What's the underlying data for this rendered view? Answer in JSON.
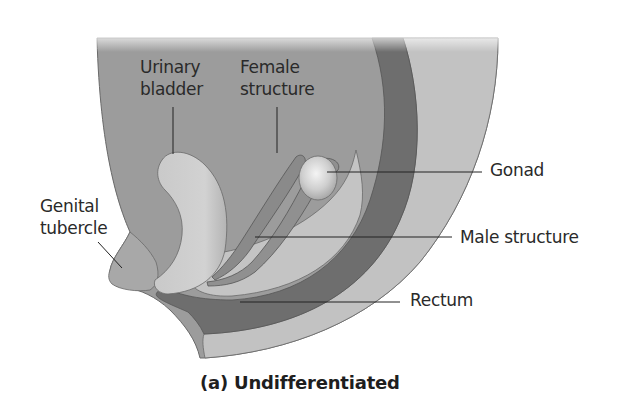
{
  "figure": {
    "caption": "(a) Undifferentiated",
    "labels": {
      "urinary_bladder": [
        "Urinary",
        "bladder"
      ],
      "female_structure": [
        "Female",
        "structure"
      ],
      "gonad": "Gonad",
      "genital_tubercle": [
        "Genital",
        "tubercle"
      ],
      "male_structure": "Male structure",
      "rectum": "Rectum"
    },
    "colors": {
      "body_dark": "#9c9c9c",
      "body_light": "#c2c2c2",
      "rectum_band": "#6e6e6e",
      "bladder": "#c8c8c8",
      "duct": "#8a8a8a",
      "gonad": "#d9d9d9",
      "leader_line": "#222222",
      "text": "#2a2a2a"
    }
  }
}
